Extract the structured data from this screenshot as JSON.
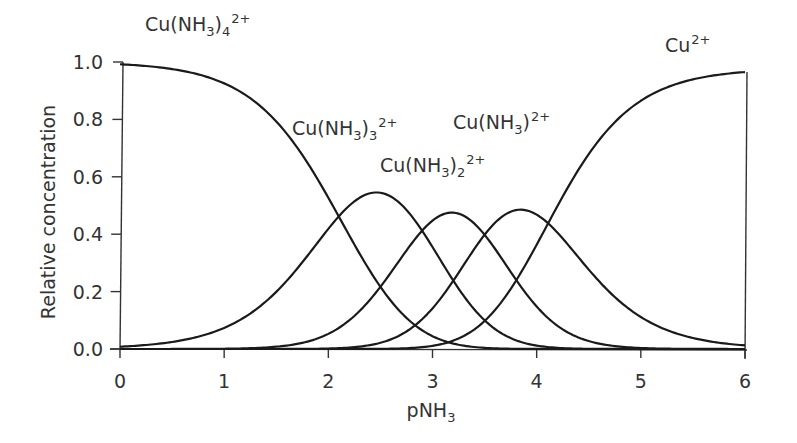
{
  "chart_data": {
    "type": "line",
    "title": "",
    "xlabel": "pNH3",
    "xlabel_parts": {
      "base": "pNH",
      "sub": "3"
    },
    "ylabel": "Relative concentration",
    "xlim": [
      0,
      6
    ],
    "ylim": [
      0.0,
      1.0
    ],
    "grid": false,
    "legend": "inline labels",
    "x_ticks": [
      0,
      1,
      2,
      3,
      4,
      5,
      6
    ],
    "x_tick_labels": [
      "0",
      "1",
      "2",
      "3",
      "4",
      "5",
      "6"
    ],
    "y_ticks": [
      0.0,
      0.2,
      0.4,
      0.6,
      0.8,
      1.0
    ],
    "y_tick_labels": [
      "0.0",
      "0.2",
      "0.4",
      "0.6",
      "0.8",
      "1.0"
    ],
    "stepwise_logK": {
      "K1": 4.1,
      "K2": 3.5,
      "K3": 2.9,
      "K4": 2.1
    },
    "cumulative_logBeta": [
      0,
      4.1,
      7.6,
      10.5,
      12.6
    ],
    "x": [
      0,
      0.5,
      1,
      1.5,
      2,
      2.5,
      3,
      3.5,
      4,
      4.5,
      5,
      5.5,
      6
    ],
    "series": [
      {
        "name": "Cu(NH3)4 2+",
        "ligands": 4,
        "values": [
          0.992,
          0.975,
          0.926,
          0.793,
          0.527,
          0.217,
          0.045,
          0.004,
          0.0,
          0.0,
          0.0,
          0.0,
          0.0
        ],
        "peak": {
          "x": 0,
          "y": 1.0
        }
      },
      {
        "name": "Cu(NH3)3 2+",
        "ligands": 3,
        "values": [
          0.008,
          0.025,
          0.074,
          0.199,
          0.419,
          0.544,
          0.355,
          0.1,
          0.012,
          0.001,
          0.0,
          0.0,
          0.0
        ],
        "peak": {
          "x": 2.45,
          "y": 0.55
        }
      },
      {
        "name": "Cu(NH3)2 2+",
        "ligands": 2,
        "values": [
          0.0,
          0.0,
          0.001,
          0.008,
          0.053,
          0.217,
          0.447,
          0.398,
          0.148,
          0.028,
          0.004,
          0.0,
          0.0
        ],
        "peak": {
          "x": 3.2,
          "y": 0.46
        }
      },
      {
        "name": "Cu(NH3) 2+",
        "ligands": 1,
        "values": [
          0.0,
          0.0,
          0.0,
          0.0,
          0.002,
          0.022,
          0.142,
          0.398,
          0.468,
          0.277,
          0.112,
          0.038,
          0.012
        ],
        "peak": {
          "x": 3.8,
          "y": 0.46
        }
      },
      {
        "name": "Cu 2+",
        "ligands": 0,
        "values": [
          0.0,
          0.0,
          0.0,
          0.0,
          0.0,
          0.001,
          0.011,
          0.1,
          0.372,
          0.695,
          0.885,
          0.961,
          0.965
        ],
        "peak": {
          "x": 6,
          "y": 0.965
        }
      }
    ],
    "annotations": [
      {
        "text": "Cu(NH3)4 2+",
        "parts": [
          [
            "Cu(NH",
            ""
          ],
          [
            "3",
            "sub"
          ],
          [
            ")",
            ""
          ],
          [
            "4",
            "sub"
          ],
          [
            "2+",
            "sup"
          ]
        ]
      },
      {
        "text": "Cu(NH3)3 2+",
        "parts": [
          [
            "Cu(NH",
            ""
          ],
          [
            "3",
            "sub"
          ],
          [
            ")",
            ""
          ],
          [
            "3",
            "sub"
          ],
          [
            "2+",
            "sup"
          ]
        ]
      },
      {
        "text": "Cu(NH3) 2+",
        "parts": [
          [
            "Cu(NH",
            ""
          ],
          [
            "3",
            "sub"
          ],
          [
            ")",
            ""
          ],
          [
            "2+",
            "sup"
          ]
        ]
      },
      {
        "text": "Cu(NH3)2 2+",
        "parts": [
          [
            "Cu(NH",
            ""
          ],
          [
            "3",
            "sub"
          ],
          [
            ")",
            ""
          ],
          [
            "2",
            "sub"
          ],
          [
            "2+",
            "sup"
          ]
        ]
      },
      {
        "text": "Cu 2+",
        "parts": [
          [
            "Cu",
            ""
          ],
          [
            "2+",
            "sup"
          ]
        ]
      }
    ]
  },
  "style": {
    "line_color": "#1a1a1a",
    "axis_color": "#333333",
    "text_color": "#333333",
    "background": "#ffffff"
  }
}
